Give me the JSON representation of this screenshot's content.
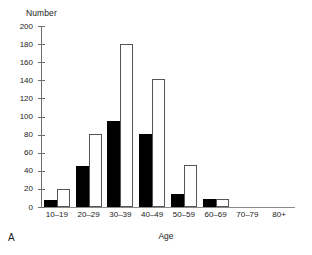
{
  "panel": {
    "letter": "A"
  },
  "chart_data": {
    "type": "bar",
    "title": "",
    "xlabel": "Age",
    "ylabel": "Number",
    "categories": [
      "10–19",
      "20–29",
      "30–39",
      "40–49",
      "50–59",
      "60–69",
      "70–79",
      "80+"
    ],
    "series": [
      {
        "name": "solid",
        "color": "#000000",
        "values": [
          8,
          45,
          95,
          81,
          14,
          9,
          0,
          0
        ]
      },
      {
        "name": "open",
        "color": "#ffffff",
        "values": [
          20,
          81,
          180,
          141,
          46,
          9,
          0,
          0
        ]
      }
    ],
    "ylim": [
      0,
      200
    ],
    "yticks": [
      0,
      20,
      40,
      60,
      80,
      100,
      120,
      140,
      160,
      180,
      200
    ],
    "ytick_labels": [
      "0",
      "20",
      "40",
      "60",
      "80",
      "100",
      "120",
      "140",
      "160",
      "180",
      "200"
    ],
    "grid": false,
    "legend": "none"
  }
}
